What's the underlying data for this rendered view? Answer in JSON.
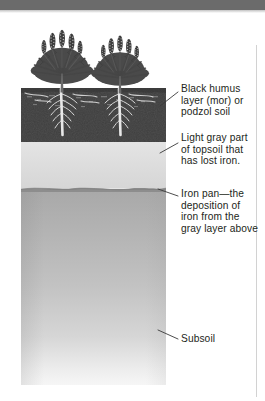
{
  "figure": {
    "header_bar_color": "#6b6b6b",
    "background_color": "#ffffff"
  },
  "diagram": {
    "type": "soil-profile-cross-section",
    "vegetation": {
      "plant_count": 2,
      "description": "heather-like shrubs with upright flower spikes",
      "color": "#4a4a4a"
    },
    "layers": [
      {
        "id": "humus",
        "name": "Black humus layer (mor) or podzol soil",
        "color": "#3f3f3f",
        "order": 1
      },
      {
        "id": "light-gray",
        "name": "Light gray part of topsoil that has lost iron.",
        "color": "#dedede",
        "order": 2
      },
      {
        "id": "iron-pan",
        "name": "Iron pan—the deposition of iron from the gray layer above",
        "color": "#8f8f8f",
        "order": 3
      },
      {
        "id": "subsoil",
        "name": "Subsoil",
        "color": "#b4b4b4",
        "order": 4
      }
    ]
  },
  "labels": {
    "humus": "Black humus layer (mor) or podzol soil",
    "light_gray": "Light gray part of topsoil that has lost iron.",
    "iron_pan": "Iron pan—the deposition of iron from the gray layer above",
    "subsoil": "Subsoil"
  }
}
